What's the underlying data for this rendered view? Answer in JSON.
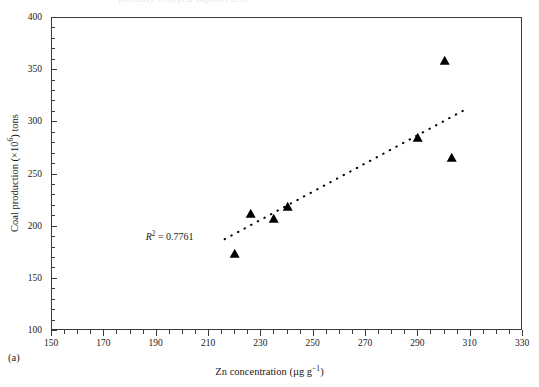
{
  "figure": {
    "panel_label": "(a)",
    "top_caption_ghost": "partially cropped caption text",
    "background": "#ffffff",
    "marker_color": "#000000",
    "axis_color": "#3a3a3a"
  },
  "annotation": {
    "r2_symbol": "R",
    "r2_exponent": "2",
    "r2_equals": " = ",
    "r2_value": "0.7761",
    "r2_text": "R2 = 0.7761"
  },
  "chart_data": {
    "type": "scatter",
    "title": "",
    "xlabel": "Zn concentration (µg g⁻¹)",
    "xlabel_main": "Zn concentration (",
    "xlabel_unit_mu": "µg g",
    "xlabel_unit_sup": "−1",
    "xlabel_close": ")",
    "ylabel": "Coal production (×10⁶) tons",
    "ylabel_main": "Coal production (×10",
    "ylabel_sup": "6",
    "ylabel_tail": ") tons",
    "xlim": [
      150,
      330
    ],
    "ylim": [
      100,
      400
    ],
    "xticks": [
      150,
      170,
      190,
      210,
      230,
      250,
      270,
      290,
      310,
      330
    ],
    "xtick_labels": [
      "150",
      "170",
      "190",
      "210",
      "230",
      "250",
      "270",
      "290",
      "310",
      "330"
    ],
    "x_minor_step": 5,
    "yticks": [
      100,
      150,
      200,
      250,
      300,
      350,
      400
    ],
    "ytick_labels": [
      "100",
      "150",
      "200",
      "250",
      "300",
      "350",
      "400"
    ],
    "y_minor_step": 10,
    "grid": false,
    "legend": null,
    "series": [
      {
        "name": "Coal production vs Zn concentration",
        "marker": "triangle",
        "color": "#000000",
        "points": [
          {
            "x": 220,
            "y": 173
          },
          {
            "x": 226,
            "y": 211
          },
          {
            "x": 235,
            "y": 206
          },
          {
            "x": 240,
            "y": 218
          },
          {
            "x": 290,
            "y": 284
          },
          {
            "x": 300,
            "y": 358
          },
          {
            "x": 303,
            "y": 265
          }
        ]
      }
    ],
    "trendline": {
      "style": "dotted",
      "color": "#000000",
      "r_squared": 0.7761,
      "x_start": 216,
      "y_start": 188,
      "x_end": 307,
      "y_end": 311
    }
  }
}
